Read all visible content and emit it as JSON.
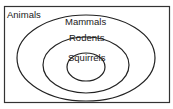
{
  "diagram": {
    "type": "nested-venn",
    "outer_label": "Animals",
    "sets": [
      {
        "label": "Mammals",
        "level": 1
      },
      {
        "label": "Rodents",
        "level": 2
      },
      {
        "label": "Squirrels",
        "level": 3
      }
    ],
    "colors": {
      "stroke": "#222222",
      "background": "#ffffff"
    }
  }
}
